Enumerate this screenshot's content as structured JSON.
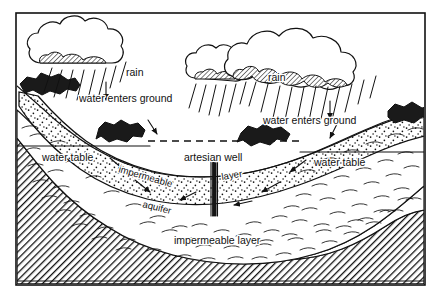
{
  "figure": {
    "type": "cross-section-diagram",
    "background_color": "#ffffff",
    "ink_color": "#111111",
    "frame": {
      "x": 16,
      "y": 13,
      "width": 409,
      "height": 272
    }
  },
  "labels": {
    "rain_left": "rain",
    "rain_right": "rain",
    "water_enters_ground_left": "water enters ground",
    "water_enters_ground_right": "water enters ground",
    "water_table_left": "water table",
    "water_table_right": "water table",
    "artesian_well": "artesian well",
    "impermeable_upper": "impermeable",
    "layer_upper": "layer",
    "aquifer": "aquifer",
    "impermeable_layer_bottom": "impermeable layer"
  },
  "elements": {
    "clouds": [
      {
        "name": "cloud-left",
        "cx": 84,
        "cy": 48
      },
      {
        "name": "cloud-mid",
        "cx": 240,
        "cy": 56
      },
      {
        "name": "cloud-right",
        "cx": 330,
        "cy": 48
      }
    ],
    "rock_outcrops": [
      {
        "name": "outcrop-left-upper"
      },
      {
        "name": "outcrop-left-lower"
      },
      {
        "name": "outcrop-center"
      },
      {
        "name": "outcrop-right"
      }
    ],
    "flow_arrows": [
      {
        "name": "infiltration-arrow-left",
        "direction": "down"
      },
      {
        "name": "infiltration-arrow-left-lower",
        "direction": "down-right"
      },
      {
        "name": "infiltration-arrow-right",
        "direction": "down"
      },
      {
        "name": "infiltration-arrow-right-lower",
        "direction": "down-left"
      },
      {
        "name": "aquifer-flow-left-1",
        "direction": "down-right"
      },
      {
        "name": "aquifer-flow-left-2",
        "direction": "down-right"
      },
      {
        "name": "aquifer-flow-right-1",
        "direction": "down-left"
      },
      {
        "name": "aquifer-flow-right-2",
        "direction": "down-left"
      },
      {
        "name": "aquifer-flow-right-3",
        "direction": "left"
      },
      {
        "name": "aquifer-flow-right-4",
        "direction": "down-left"
      }
    ],
    "well": {
      "name": "artesian-well-pipe",
      "x": 214,
      "top_y": 162,
      "bottom_y": 215
    },
    "potentiometric_surface": {
      "name": "dashed-pressure-surface",
      "style": "dashed"
    },
    "strata": [
      {
        "name": "upper-impermeable-layer",
        "pattern": "wavy-dashes"
      },
      {
        "name": "aquifer-layer",
        "pattern": "stipple-dots"
      },
      {
        "name": "lower-impermeable-layer",
        "pattern": "wavy-dashes"
      },
      {
        "name": "bedrock",
        "pattern": "diagonal-hatch"
      }
    ]
  }
}
